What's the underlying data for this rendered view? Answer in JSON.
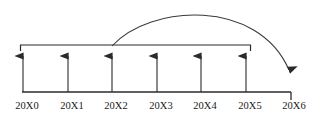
{
  "diagram": {
    "colors": {
      "background": "#ffffff",
      "line": "#2b2b2b",
      "arc": "#3a3a3a",
      "text": "#1a1a1a"
    },
    "baseline": {
      "y": 92,
      "x_start": 22,
      "x_end": 291
    },
    "bracket": {
      "y": 45,
      "x_start": 20,
      "x_end": 251,
      "end_stub_height": 6
    },
    "axis_labels": [
      {
        "text": "20X0",
        "x": 27,
        "tick_x": 23
      },
      {
        "text": "20X1",
        "x": 72,
        "tick_x": 68
      },
      {
        "text": "20X2",
        "x": 116,
        "tick_x": 112
      },
      {
        "text": "20X3",
        "x": 161,
        "tick_x": 157
      },
      {
        "text": "20X4",
        "x": 205,
        "tick_x": 201
      },
      {
        "text": "20X5",
        "x": 250,
        "tick_x": 246
      },
      {
        "text": "20X6",
        "x": 294,
        "tick_x": 291
      }
    ],
    "up_arrows": [
      {
        "label": "20X0",
        "x": 23,
        "y_from": 92,
        "y_to": 47
      },
      {
        "label": "20X1",
        "x": 68,
        "y_from": 92,
        "y_to": 47
      },
      {
        "label": "20X2",
        "x": 112,
        "y_from": 92,
        "y_to": 47
      },
      {
        "label": "20X3",
        "x": 157,
        "y_from": 92,
        "y_to": 47
      },
      {
        "label": "20X4",
        "x": 201,
        "y_from": 92,
        "y_to": 47
      },
      {
        "label": "20X5",
        "x": 246,
        "y_from": 92,
        "y_to": 47
      }
    ],
    "curved_arrow": {
      "from_label": "20X2",
      "to_label": "20X6",
      "start_x": 112,
      "start_y": 46,
      "end_x": 290,
      "end_y": 84,
      "apex_y": 13
    },
    "end_tick": {
      "x": 291,
      "y_from": 92,
      "y_to": 100
    }
  }
}
